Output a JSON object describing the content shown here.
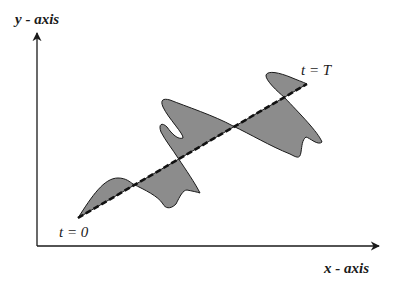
{
  "diagram": {
    "axes": {
      "y_label": "y - axis",
      "x_label": "x - axis"
    },
    "annotations": {
      "start_label": "t = 0",
      "end_label": "t = T"
    },
    "elements": {
      "trajectory_line": "dashed straight line from t = 0 to t = T",
      "deviation_region": "shaded area between oscillating curve and dashed line"
    },
    "colors": {
      "fill": "#8c8c8c",
      "stroke": "#1a1a1a",
      "background": "#ffffff"
    }
  }
}
